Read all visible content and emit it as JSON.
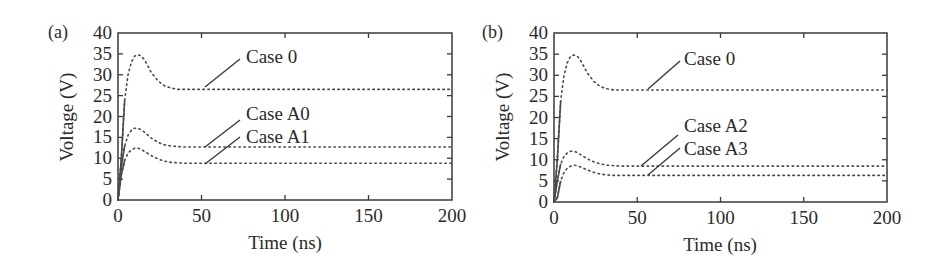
{
  "chart_data": [
    {
      "type": "line",
      "panel_label": "(a)",
      "xlabel": "Time (ns)",
      "ylabel": "Voltage (V)",
      "xlim": [
        0,
        200
      ],
      "ylim": [
        0,
        40
      ],
      "xticks": [
        0,
        50,
        100,
        150,
        200
      ],
      "yticks": [
        0,
        5,
        10,
        15,
        20,
        25,
        30,
        35,
        40
      ],
      "grid": false,
      "series": [
        {
          "name": "Case 0",
          "x": [
            0,
            2,
            4,
            6,
            8,
            10,
            12,
            14,
            16,
            18,
            20,
            24,
            28,
            32,
            36,
            40,
            50,
            100,
            150,
            200
          ],
          "y": [
            0,
            10,
            24,
            30,
            33,
            34.5,
            34.8,
            34.5,
            33.5,
            32,
            30.5,
            28.5,
            27.3,
            26.8,
            26.5,
            26.5,
            26.5,
            26.5,
            26.5,
            26.5
          ]
        },
        {
          "name": "Case A0",
          "x": [
            0,
            2,
            4,
            6,
            8,
            10,
            12,
            14,
            16,
            20,
            24,
            28,
            32,
            36,
            40,
            50,
            100,
            150,
            200
          ],
          "y": [
            0,
            8,
            13,
            15.5,
            16.7,
            17.2,
            17.2,
            16.8,
            16.2,
            14.8,
            13.8,
            13.2,
            12.9,
            12.8,
            12.7,
            12.7,
            12.7,
            12.7,
            12.7
          ]
        },
        {
          "name": "Case A1",
          "x": [
            0,
            2,
            4,
            6,
            8,
            10,
            12,
            14,
            16,
            20,
            24,
            28,
            32,
            36,
            40,
            50,
            100,
            150,
            200
          ],
          "y": [
            0,
            6,
            9.5,
            11.2,
            12,
            12.4,
            12.4,
            12.1,
            11.6,
            10.6,
            9.8,
            9.3,
            9,
            8.9,
            8.8,
            8.8,
            8.8,
            8.8,
            8.8
          ]
        }
      ],
      "annotations": [
        {
          "text": "Case 0",
          "arrow_to": [
            50,
            26.5
          ]
        },
        {
          "text": "Case A0",
          "arrow_to": [
            50,
            12.7
          ]
        },
        {
          "text": "Case A1",
          "arrow_to": [
            50,
            8.8
          ]
        }
      ]
    },
    {
      "type": "line",
      "panel_label": "(b)",
      "xlabel": "Time (ns)",
      "ylabel": "Voltage (V)",
      "xlim": [
        0,
        200
      ],
      "ylim": [
        0,
        40
      ],
      "xticks": [
        0,
        50,
        100,
        150,
        200
      ],
      "yticks": [
        0,
        5,
        10,
        15,
        20,
        25,
        30,
        35,
        40
      ],
      "grid": false,
      "series": [
        {
          "name": "Case 0",
          "x": [
            0,
            2,
            4,
            6,
            8,
            10,
            12,
            14,
            16,
            18,
            20,
            24,
            28,
            32,
            36,
            40,
            50,
            100,
            150,
            200
          ],
          "y": [
            0,
            10,
            24,
            30,
            33,
            34.5,
            34.8,
            34.5,
            33.5,
            32,
            30.5,
            28.5,
            27.3,
            26.8,
            26.5,
            26.5,
            26.5,
            26.5,
            26.5,
            26.5
          ]
        },
        {
          "name": "Case A2",
          "x": [
            0,
            2,
            4,
            6,
            8,
            10,
            12,
            14,
            16,
            20,
            24,
            28,
            32,
            36,
            40,
            50,
            100,
            150,
            200
          ],
          "y": [
            0,
            5,
            9,
            10.8,
            11.6,
            12,
            12,
            11.7,
            11.2,
            10.2,
            9.5,
            9,
            8.7,
            8.6,
            8.5,
            8.5,
            8.5,
            8.5,
            8.5
          ]
        },
        {
          "name": "Case A3",
          "x": [
            0,
            2,
            4,
            6,
            8,
            10,
            12,
            14,
            16,
            20,
            24,
            28,
            32,
            36,
            40,
            50,
            100,
            150,
            200
          ],
          "y": [
            0,
            1,
            5,
            7,
            8,
            8.5,
            8.7,
            8.6,
            8.3,
            7.6,
            7,
            6.6,
            6.4,
            6.3,
            6.3,
            6.3,
            6.3,
            6.3,
            6.3
          ]
        }
      ],
      "annotations": [
        {
          "text": "Case 0",
          "arrow_to": [
            55,
            26.5
          ]
        },
        {
          "text": "Case A2",
          "arrow_to": [
            52,
            8.5
          ]
        },
        {
          "text": "Case A3",
          "arrow_to": [
            55,
            6.3
          ]
        }
      ]
    }
  ],
  "panels": [
    {
      "label": "(a)",
      "xlabel": "Time (ns)",
      "ylabel": "Voltage (V)",
      "xtick_labels": [
        "0",
        "50",
        "100",
        "150",
        "200"
      ],
      "ytick_labels": [
        "0",
        "5",
        "10",
        "15",
        "20",
        "25",
        "30",
        "35",
        "40"
      ],
      "annotations": [
        "Case 0",
        "Case A0",
        "Case A1"
      ]
    },
    {
      "label": "(b)",
      "xlabel": "Time (ns)",
      "ylabel": "Voltage (V)",
      "xtick_labels": [
        "0",
        "50",
        "100",
        "150",
        "200"
      ],
      "ytick_labels": [
        "0",
        "5",
        "10",
        "15",
        "20",
        "25",
        "30",
        "35",
        "40"
      ],
      "annotations": [
        "Case 0",
        "Case A2",
        "Case A3"
      ]
    }
  ],
  "colors": {
    "axis": "#3a3a3a",
    "line": "#4a4a4a",
    "text": "#2b2b2b",
    "background": "#ffffff"
  }
}
